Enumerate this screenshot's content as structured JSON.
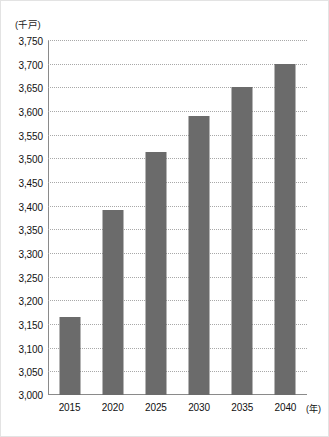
{
  "chart_data": {
    "type": "bar",
    "title": "",
    "subtitle": "",
    "xlabel": "(年)",
    "ylabel": "(千戸)",
    "categories": [
      "2015",
      "2020",
      "2025",
      "2030",
      "2035",
      "2040"
    ],
    "values": [
      3165,
      3390,
      3513,
      3590,
      3650,
      3700
    ],
    "series": [
      {
        "name": "世帯数",
        "values": [
          3165,
          3390,
          3513,
          3590,
          3650,
          3700
        ]
      }
    ],
    "ylim": [
      3000,
      3750
    ],
    "ytick_step": 50,
    "ytick_labels": [
      "3,750",
      "3,700",
      "3,650",
      "3,600",
      "3,550",
      "3,500",
      "3,450",
      "3,400",
      "3,350",
      "3,300",
      "3,250",
      "3,200",
      "3,150",
      "3,100",
      "3,050",
      "3,000"
    ],
    "ytick_values": [
      3750,
      3700,
      3650,
      3600,
      3550,
      3500,
      3450,
      3400,
      3350,
      3300,
      3250,
      3200,
      3150,
      3100,
      3050,
      3000
    ],
    "grid": true,
    "grid_style": "dotted",
    "legend": false,
    "legend_position": "none",
    "bar_color": "#6b6b6b",
    "grid_color": "#a8a8a8",
    "axis_color": "#8a8a8a",
    "text_color": "#111111",
    "background_color": "#ffffff",
    "annotations": []
  },
  "axes": {
    "y_unit_label": "(千戸)",
    "x_unit_label": "(年)"
  },
  "footer": {
    "source_note": ""
  }
}
